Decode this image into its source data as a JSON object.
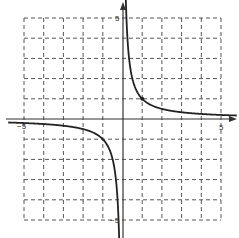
{
  "chart_data": {
    "type": "line",
    "title": "",
    "function": "y = 1/x",
    "xlabel": "",
    "ylabel": "",
    "xlim": [
      -5,
      5
    ],
    "ylim": [
      -5,
      5
    ],
    "grid": true,
    "grid_style": "dashed",
    "grid_step": 1,
    "tick_labels": {
      "x_min": "−5",
      "x_max": "5",
      "y_max": "5",
      "y_min": "−5"
    },
    "series": [
      {
        "name": "branch-positive",
        "x": [
          0.2,
          0.25,
          0.5,
          1,
          2,
          3,
          4,
          5
        ],
        "y": [
          5,
          4,
          2,
          1,
          0.5,
          0.333,
          0.25,
          0.2
        ]
      },
      {
        "name": "branch-negative",
        "x": [
          -5,
          -4,
          -3,
          -2,
          -1,
          -0.5,
          -0.25,
          -0.2
        ],
        "y": [
          -0.2,
          -0.25,
          -0.333,
          -0.5,
          -1,
          -2,
          -4,
          -5
        ]
      }
    ],
    "marked_points": [
      {
        "x": 1,
        "y": 1
      }
    ],
    "asymptotes": {
      "vertical": 0,
      "horizontal": 0
    },
    "legend": null
  },
  "colors": {
    "curve": "#222222",
    "axis": "#333333",
    "grid": "#555555",
    "background": "#ffffff"
  }
}
